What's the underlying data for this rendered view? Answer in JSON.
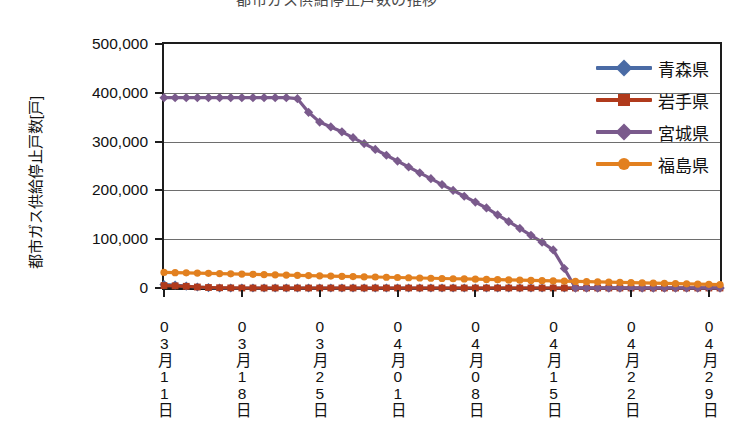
{
  "figure": {
    "clipped_top_text": "都市ガス供給停止戸数の推移",
    "y_axis_title": "都市ガス供給停止戸数[戸]"
  },
  "legend": {
    "items": [
      {
        "label": "青森県",
        "color": "#4a6ba5",
        "marker": "diamond"
      },
      {
        "label": "岩手県",
        "color": "#b03a1c",
        "marker": "square"
      },
      {
        "label": "宮城県",
        "color": "#7a5a8c",
        "marker": "diamond"
      },
      {
        "label": "福島県",
        "color": "#e2801f",
        "marker": "circle"
      }
    ]
  },
  "chart_data": {
    "type": "line",
    "title": "都市ガス供給停止戸数の推移",
    "xlabel": "",
    "ylabel": "都市ガス供給停止戸数[戸]",
    "ylim": [
      0,
      500000
    ],
    "ytick_labels": [
      "0",
      "100,000",
      "200,000",
      "300,000",
      "400,000",
      "500,000"
    ],
    "ytick_values": [
      0,
      100000,
      200000,
      300000,
      400000,
      500000
    ],
    "grid": true,
    "legend_position": "top-right-inside",
    "x": [
      "03月11日",
      "03月12日",
      "03月13日",
      "03月14日",
      "03月15日",
      "03月16日",
      "03月17日",
      "03月18日",
      "03月19日",
      "03月20日",
      "03月21日",
      "03月22日",
      "03月23日",
      "03月24日",
      "03月25日",
      "03月26日",
      "03月27日",
      "03月28日",
      "03月29日",
      "03月30日",
      "03月31日",
      "04月01日",
      "04月02日",
      "04月03日",
      "04月04日",
      "04月05日",
      "04月06日",
      "04月07日",
      "04月08日",
      "04月09日",
      "04月10日",
      "04月11日",
      "04月12日",
      "04月13日",
      "04月14日",
      "04月15日",
      "04月16日",
      "04月17日",
      "04月18日",
      "04月19日",
      "04月20日",
      "04月21日",
      "04月22日",
      "04月23日",
      "04月24日",
      "04月25日",
      "04月26日",
      "04月27日",
      "04月28日",
      "04月29日",
      "04月30日"
    ],
    "xtick_labels": [
      "03月11日",
      "03月18日",
      "03月25日",
      "04月01日",
      "04月08日",
      "04月15日",
      "04月22日",
      "04月29日"
    ],
    "xtick_indices": [
      0,
      7,
      14,
      21,
      28,
      35,
      42,
      49
    ],
    "series": [
      {
        "name": "青森県",
        "color": "#4a6ba5",
        "marker": "diamond",
        "values": [
          7000,
          6000,
          4000,
          2000,
          800,
          0,
          0,
          0,
          0,
          0,
          0,
          0,
          0,
          0,
          0,
          0,
          0,
          0,
          0,
          0,
          0,
          0,
          0,
          0,
          0,
          0,
          0,
          0,
          0,
          0,
          0,
          0,
          0,
          0,
          0,
          0,
          0,
          0,
          0,
          0,
          0,
          0,
          0,
          0,
          0,
          0,
          0,
          0,
          0,
          0,
          0
        ]
      },
      {
        "name": "岩手県",
        "color": "#b03a1c",
        "marker": "square",
        "values": [
          5000,
          4500,
          3500,
          2000,
          1000,
          500,
          200,
          0,
          0,
          0,
          0,
          0,
          0,
          0,
          0,
          0,
          0,
          0,
          0,
          0,
          0,
          0,
          0,
          0,
          0,
          0,
          0,
          0,
          0,
          0,
          0,
          0,
          0,
          0,
          0,
          0,
          0,
          0,
          0,
          0,
          0,
          0,
          0,
          0,
          0,
          0,
          0,
          0,
          0,
          0,
          0
        ]
      },
      {
        "name": "宮城県",
        "color": "#7a5a8c",
        "marker": "diamond",
        "values": [
          390000,
          390000,
          390000,
          390000,
          390000,
          390000,
          390000,
          390000,
          390000,
          390000,
          390000,
          390000,
          388000,
          360000,
          340000,
          330000,
          320000,
          308000,
          296000,
          284000,
          272000,
          260000,
          248000,
          236000,
          224000,
          212000,
          200000,
          188000,
          176000,
          164000,
          150000,
          136000,
          122000,
          108000,
          94000,
          78000,
          40000,
          0,
          0,
          0,
          0,
          0,
          0,
          0,
          0,
          0,
          0,
          0,
          0,
          0,
          0
        ]
      },
      {
        "name": "福島県",
        "color": "#e2801f",
        "marker": "circle",
        "values": [
          32000,
          31500,
          31000,
          30500,
          30000,
          29500,
          29000,
          28500,
          28000,
          27500,
          27000,
          26500,
          26000,
          25500,
          25000,
          24500,
          24000,
          23500,
          23000,
          22500,
          22000,
          21500,
          21000,
          20500,
          20000,
          19500,
          19000,
          18500,
          18000,
          17500,
          17000,
          16500,
          16000,
          15500,
          15000,
          14500,
          14000,
          13500,
          13000,
          12500,
          12000,
          11500,
          11000,
          10500,
          10000,
          9500,
          9000,
          8500,
          8000,
          7500,
          7000
        ]
      }
    ]
  }
}
